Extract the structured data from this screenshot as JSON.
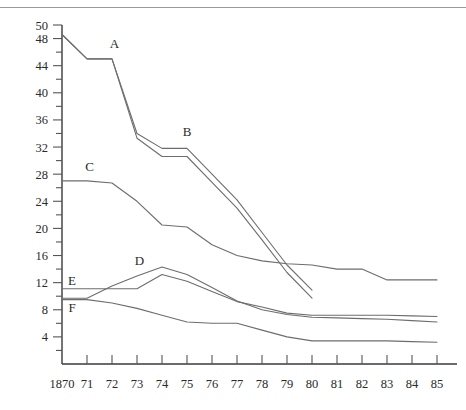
{
  "chart_data": {
    "type": "line",
    "title": "",
    "xlabel": "",
    "ylabel": "",
    "xlim": [
      1870,
      1885
    ],
    "ylim": [
      0,
      50
    ],
    "grid": false,
    "legend": "inline-labels",
    "x": [
      1870,
      1871,
      1872,
      1873,
      1874,
      1875,
      1876,
      1877,
      1878,
      1879,
      1880,
      1881,
      1882,
      1883,
      1884,
      1885
    ],
    "x_tick_labels": [
      "1870",
      "71",
      "72",
      "73",
      "74",
      "75",
      "76",
      "77",
      "78",
      "79",
      "80",
      "81",
      "82",
      "83",
      "84",
      "85"
    ],
    "y_tick_labels": [
      "4",
      "8",
      "12",
      "16",
      "20",
      "24",
      "28",
      "32",
      "36",
      "40",
      "44",
      "48",
      "50"
    ],
    "y_ticks_major": [
      4,
      8,
      12,
      16,
      20,
      24,
      28,
      32,
      36,
      40,
      44,
      48,
      50
    ],
    "y_tick_interval_minor": 2,
    "series": [
      {
        "name": "A",
        "label": "A",
        "label_x": 1872.1,
        "label_y": 46.6,
        "x": [
          1870,
          1871,
          1872,
          1873,
          1874,
          1875,
          1876,
          1877,
          1878,
          1879,
          1880
        ],
        "values": [
          48.6,
          45.0,
          45.0,
          34.0,
          31.8,
          31.8,
          28.0,
          24.2,
          19.4,
          14.6,
          10.9
        ]
      },
      {
        "name": "B",
        "label": "B",
        "label_x": 1875.0,
        "label_y": 33.6,
        "x": [
          1870,
          1871,
          1872,
          1873,
          1874,
          1875,
          1876,
          1877,
          1878,
          1879,
          1880
        ],
        "values": [
          48.6,
          45.0,
          45.0,
          33.3,
          30.6,
          30.6,
          26.8,
          23.0,
          18.3,
          13.5,
          9.7
        ]
      },
      {
        "name": "C",
        "label": "C",
        "label_x": 1871.1,
        "label_y": 28.4,
        "x": [
          1870,
          1871,
          1872,
          1873,
          1874,
          1875,
          1876,
          1877,
          1878,
          1879,
          1880,
          1881,
          1882,
          1883,
          1884,
          1885
        ],
        "values": [
          27.0,
          27.0,
          26.7,
          24.0,
          20.5,
          20.2,
          17.6,
          16.0,
          15.2,
          14.8,
          14.6,
          14.0,
          14.0,
          12.4,
          12.4,
          12.4
        ]
      },
      {
        "name": "D",
        "label": "D",
        "label_x": 1873.1,
        "label_y": 14.6,
        "x": [
          1870,
          1871,
          1872,
          1873,
          1874,
          1875,
          1876,
          1877,
          1878,
          1879,
          1880,
          1881,
          1882,
          1883,
          1884,
          1885
        ],
        "values": [
          9.7,
          9.7,
          11.5,
          13.0,
          14.3,
          13.2,
          11.3,
          9.3,
          8.0,
          7.3,
          6.9,
          6.8,
          6.7,
          6.6,
          6.4,
          6.2
        ]
      },
      {
        "name": "E",
        "label": "E",
        "label_x": 1870.4,
        "label_y": 11.6,
        "x": [
          1870,
          1871,
          1872,
          1873,
          1874,
          1875,
          1876,
          1877,
          1878,
          1879,
          1880,
          1881,
          1882,
          1883,
          1884,
          1885
        ],
        "values": [
          11.1,
          11.1,
          11.1,
          11.1,
          13.2,
          12.2,
          10.7,
          9.2,
          8.4,
          7.5,
          7.2,
          7.2,
          7.2,
          7.2,
          7.1,
          7.0
        ]
      },
      {
        "name": "F",
        "label": "F",
        "label_x": 1870.4,
        "label_y": 7.6,
        "x": [
          1870,
          1871,
          1872,
          1873,
          1874,
          1875,
          1876,
          1877,
          1878,
          1879,
          1880,
          1881,
          1882,
          1883,
          1884,
          1885
        ],
        "values": [
          9.5,
          9.5,
          9.0,
          8.2,
          7.2,
          6.2,
          6.0,
          6.0,
          5.0,
          4.0,
          3.4,
          3.4,
          3.4,
          3.4,
          3.3,
          3.2
        ]
      }
    ],
    "colors": {
      "line": "#6d6d6d",
      "axis": "#3a3a3a",
      "text": "#2a2a2a",
      "background": "#ffffff"
    }
  }
}
